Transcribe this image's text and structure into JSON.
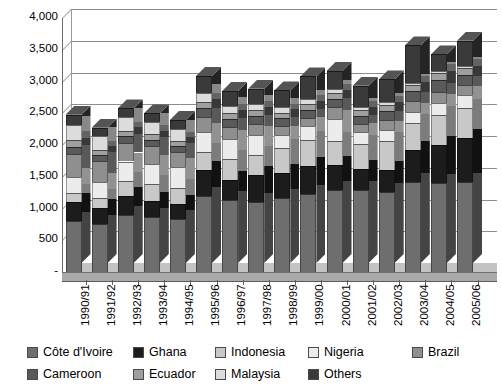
{
  "chart_data": {
    "type": "bar",
    "subtype": "stacked-column-3d",
    "title": "",
    "xlabel": "",
    "ylabel": "",
    "ylim": [
      0,
      4000
    ],
    "ytick_interval": 500,
    "ytick_labels": [
      "4,000",
      "3,500",
      "3,000",
      "2,500",
      "2,000",
      "1,500",
      "1,000",
      "500",
      "-"
    ],
    "ytick_values": [
      4000,
      3500,
      3000,
      2500,
      2000,
      1500,
      1000,
      500,
      0
    ],
    "grid": true,
    "grid_axis": "y",
    "legend_position": "bottom",
    "legend_columns": 5,
    "categories": [
      "1990/91",
      "1991/92",
      "1992/93",
      "1993/94",
      "1994/95",
      "1995/96",
      "1996/97",
      "1997/98",
      "1998/99",
      "1999/00",
      "2000/01",
      "2001/02",
      "2002/03",
      "2003/04",
      "2004/05",
      "2005/06"
    ],
    "series": [
      {
        "name": "Côte d'Ivoire",
        "color": "#6e6e6e",
        "values": [
          805,
          750,
          900,
          865,
          830,
          1200,
          1135,
          1110,
          1165,
          1230,
          1290,
          1285,
          1265,
          1420,
          1405,
          1420
        ]
      },
      {
        "name": "Ghana",
        "color": "#1c1c1c",
        "values": [
          290,
          250,
          300,
          260,
          240,
          400,
          320,
          410,
          395,
          440,
          390,
          340,
          340,
          495,
          600,
          690
        ]
      },
      {
        "name": "Indonesia",
        "color": "#c8c8c8",
        "values": [
          150,
          160,
          240,
          255,
          260,
          285,
          325,
          330,
          390,
          410,
          385,
          390,
          455,
          430,
          460,
          480
        ]
      },
      {
        "name": "Nigeria",
        "color": "#ececec",
        "values": [
          245,
          260,
          300,
          320,
          325,
          325,
          320,
          310,
          210,
          225,
          340,
          185,
          175,
          180,
          200,
          190
        ]
      },
      {
        "name": "Brazil",
        "color": "#8f8f8f",
        "values": [
          368,
          320,
          295,
          285,
          230,
          231,
          185,
          170,
          140,
          125,
          197,
          124,
          163,
          163,
          171,
          162
        ]
      },
      {
        "name": "Cameroon",
        "color": "#5a5a5a",
        "values": [
          115,
          95,
          100,
          98,
          105,
          135,
          125,
          130,
          120,
          125,
          120,
          135,
          140,
          165,
          180,
          165
        ]
      },
      {
        "name": "Ecuador",
        "color": "#9f9f9f",
        "values": [
          100,
          85,
          80,
          85,
          80,
          105,
          100,
          95,
          90,
          95,
          95,
          85,
          90,
          90,
          115,
          110
        ]
      },
      {
        "name": "Malaysia",
        "color": "#dcdcdc",
        "values": [
          247,
          220,
          220,
          200,
          180,
          130,
          110,
          95,
          85,
          75,
          70,
          55,
          45,
          40,
          35,
          30
        ]
      },
      {
        "name": "Others",
        "color": "#3a3a3a",
        "values": [
          155,
          130,
          140,
          130,
          145,
          275,
          230,
          235,
          265,
          355,
          280,
          335,
          360,
          585,
          260,
          395
        ]
      }
    ],
    "totals": [
      2475,
      2270,
      2575,
      2498,
      2395,
      3086,
      2850,
      2885,
      2860,
      3080,
      3167,
      2934,
      3033,
      3568,
      3426,
      3642
    ],
    "annotations": []
  },
  "legend": {
    "items": [
      {
        "label": "Côte d'Ivoire",
        "color": "#6e6e6e"
      },
      {
        "label": "Ghana",
        "color": "#1c1c1c"
      },
      {
        "label": "Indonesia",
        "color": "#c8c8c8"
      },
      {
        "label": "Nigeria",
        "color": "#ececec"
      },
      {
        "label": "Brazil",
        "color": "#8f8f8f"
      },
      {
        "label": "Cameroon",
        "color": "#5a5a5a"
      },
      {
        "label": "Ecuador",
        "color": "#9f9f9f"
      },
      {
        "label": "Malaysia",
        "color": "#dcdcdc"
      },
      {
        "label": "Others",
        "color": "#3a3a3a"
      }
    ]
  }
}
